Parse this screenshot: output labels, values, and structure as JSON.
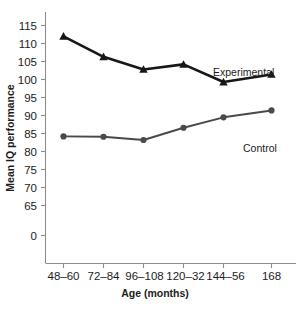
{
  "chart_data": {
    "type": "line",
    "title": "",
    "xlabel": "Age (months)",
    "ylabel": "Mean IQ performance",
    "categories": [
      "48–60",
      "72–84",
      "96–108",
      "120–32",
      "144–56",
      "168"
    ],
    "yticks": [
      "0",
      "65",
      "70",
      "75",
      "80",
      "85",
      "90",
      "95",
      "100",
      "105",
      "110",
      "115"
    ],
    "ylim": [
      62.5,
      117.5
    ],
    "axis_break": true,
    "grid": false,
    "legend_position": "inline-right",
    "series": [
      {
        "name": "Experimental",
        "marker": "triangle",
        "color": "#171717",
        "values": [
          112.0,
          106.3,
          102.8,
          104.2,
          99.3,
          101.4
        ]
      },
      {
        "name": "Control",
        "marker": "circle",
        "color": "#4a4a4a",
        "values": [
          84.2,
          84.1,
          83.2,
          86.6,
          89.5,
          91.4
        ]
      }
    ]
  },
  "axis": {
    "y_title": "Mean IQ performance",
    "x_title": "Age (months)",
    "zero_label": "0"
  },
  "labels": {
    "experimental": "Experimental",
    "control": "Control"
  },
  "caption": {
    "text": ""
  },
  "colors": {
    "experimental": "#171717",
    "control": "#4a4a4a",
    "axis": "#8d8d8d",
    "text": "#1c1c1c",
    "background": "#ffffff"
  }
}
